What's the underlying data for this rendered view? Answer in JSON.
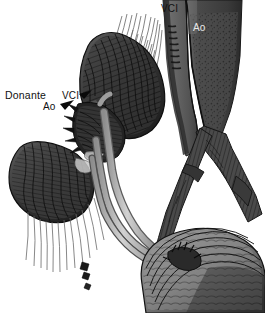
{
  "figure": {
    "background_color": "#ffffff",
    "width": 265,
    "height": 313,
    "style": "grayscale hatched medical line engraving"
  },
  "labels": {
    "donante": "Donante",
    "vci_donor": "VCI",
    "ao_donor": "Ao",
    "vci_top": "VCI",
    "ao_top": "Ao"
  },
  "colors": {
    "background": "#ffffff",
    "ink": "#111111",
    "label_light": "#e8e8e8",
    "vessel_dark": "#3c3c3c",
    "vessel_mid": "#555555",
    "vessel_light": "#a9a9a9",
    "organ_dark": "#2e2e2e",
    "organ_mid": "#4d4d4d",
    "tube_light": "#b8b8b8",
    "tube_shadow": "#6e6e6e",
    "bladder_light": "#8f8f8f",
    "bladder_dark": "#3a3a3a"
  },
  "structures": [
    {
      "name": "inferior-vena-cava",
      "label": "VCI",
      "region": "upper-right-left-vessel"
    },
    {
      "name": "aorta",
      "label": "Ao",
      "region": "upper-right-right-vessel"
    },
    {
      "name": "donor-kidney",
      "label": "",
      "region": "upper-center"
    },
    {
      "name": "native-kidney",
      "label": "",
      "region": "mid-left"
    },
    {
      "name": "donor-vessel-stumps",
      "label": "Donante",
      "region": "mid-left-center"
    },
    {
      "name": "iliac-bifurcation",
      "label": "",
      "region": "right-center"
    },
    {
      "name": "renal-vessels",
      "label": "",
      "region": "center"
    },
    {
      "name": "ureter",
      "label": "",
      "region": "center-to-bladder"
    },
    {
      "name": "bladder",
      "label": "",
      "region": "bottom-right"
    }
  ]
}
